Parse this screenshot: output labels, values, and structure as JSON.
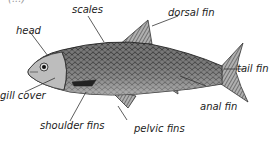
{
  "title_fragment": "(...)",
  "labels": {
    "head": "head",
    "scales": "scales",
    "dorsal_fin": "dorsal fin",
    "tail_fin": "tail fin",
    "gill_cover": "gill cover",
    "shoulder_fins": "shoulder fins",
    "pelvic_fins": "pelvic fins",
    "anal_fin": "anal fin"
  },
  "colors": {
    "ink": "#222222",
    "body": "#6e6e6e",
    "belly": "#d8d8d8",
    "fin": "#8a8a8a"
  }
}
